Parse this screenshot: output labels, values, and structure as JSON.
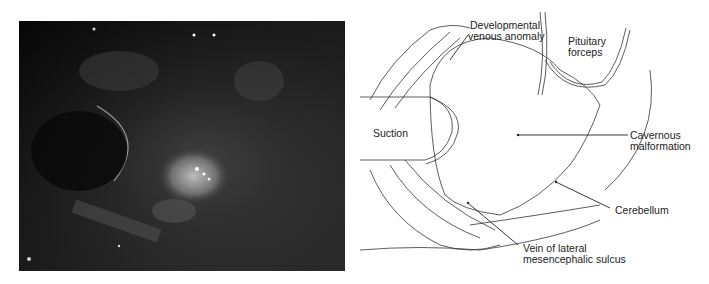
{
  "figure": {
    "left_panel": {
      "type": "intraoperative photograph",
      "description": "dark endoscopic surgical view"
    },
    "right_panel": {
      "type": "illustration",
      "labels": {
        "dva_line1": "Developmental",
        "dva_line2": "venous anomaly",
        "forceps_line1": "Pituitary",
        "forceps_line2": "forceps",
        "suction": "Suction",
        "cavernous_line1": "Cavernous",
        "cavernous_line2": "malformation",
        "cerebellum": "Cerebellum",
        "vein_line1": "Vein of lateral",
        "vein_line2": "mesencephalic sulcus"
      }
    }
  }
}
